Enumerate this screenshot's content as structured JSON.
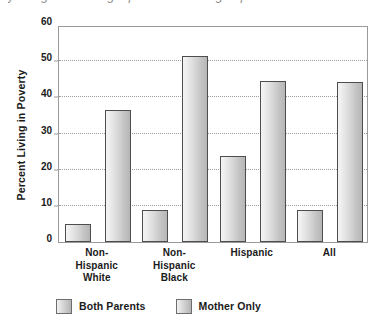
{
  "caption_remnant": "y living with a single parent are living in poverty,",
  "chart_data": {
    "type": "bar",
    "title": "",
    "xlabel": "",
    "ylabel": "Percent Living in Poverty",
    "categories": [
      "Non-\nHispanic\nWhite",
      "Non-\nHispanic\nBlack",
      "Hispanic",
      "All"
    ],
    "category_lines": [
      [
        "Non-",
        "Hispanic",
        "White"
      ],
      [
        "Non-",
        "Hispanic",
        "Black"
      ],
      [
        "Hispanic"
      ],
      [
        "All"
      ]
    ],
    "series": [
      {
        "name": "Both Parents",
        "values": [
          5.0,
          8.8,
          23.7,
          8.8
        ]
      },
      {
        "name": "Mother Only",
        "values": [
          36.5,
          51.5,
          44.4,
          44.3
        ]
      }
    ],
    "ylim": [
      0,
      60
    ],
    "yticks": [
      0,
      10,
      20,
      30,
      40,
      50,
      60
    ],
    "ytick_labels": [
      "0",
      "10",
      "20",
      "30",
      "40",
      "50",
      "60"
    ],
    "grid": true,
    "grid_axis": "y",
    "legend_position": "bottom-left",
    "bar_fill": "#d3d3d3",
    "bar_edge": "#4d4d4d",
    "grid_color": "#9d9d9d",
    "frame_color": "#9a9a9a"
  },
  "legend": {
    "items": [
      {
        "label": "Both Parents",
        "color": "#d3d3d3"
      },
      {
        "label": "Mother Only",
        "color": "#d3d3d3"
      }
    ]
  }
}
